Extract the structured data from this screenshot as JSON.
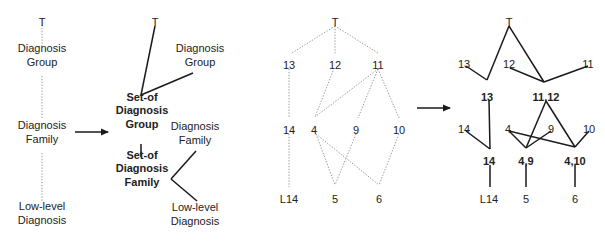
{
  "colors": {
    "text": "#222222",
    "solid_edge": "#1a1a1a",
    "dotted_edge": "#888888",
    "background": "#ffffff"
  },
  "panels": [
    {
      "id": "schema-hierarchy",
      "nodes": [
        {
          "id": "top",
          "lines": [
            "T"
          ],
          "x": 42,
          "y": 22,
          "bold": false
        },
        {
          "id": "diag-group",
          "lines": [
            "Diagnosis",
            "Group"
          ],
          "x": 42,
          "y": 55,
          "bold": false
        },
        {
          "id": "diag-family",
          "lines": [
            "Diagnosis",
            "Family"
          ],
          "x": 42,
          "y": 132,
          "bold": false
        },
        {
          "id": "low-level",
          "lines": [
            "Low-level",
            "Diagnosis"
          ],
          "x": 42,
          "y": 213,
          "bold": false
        }
      ],
      "edges": [
        {
          "from": [
            42,
            25
          ],
          "to": [
            42,
            46
          ],
          "style": "dotted"
        },
        {
          "from": [
            42,
            76
          ],
          "to": [
            42,
            119
          ],
          "style": "dotted"
        },
        {
          "from": [
            42,
            153
          ],
          "to": [
            42,
            202
          ],
          "style": "dotted"
        }
      ]
    },
    {
      "id": "set-of-hierarchy",
      "nodes": [
        {
          "id": "top",
          "lines": [
            "T"
          ],
          "x": 155,
          "y": 22,
          "bold": false
        },
        {
          "id": "diag-group",
          "lines": [
            "Diagnosis",
            "Group"
          ],
          "x": 200,
          "y": 55,
          "bold": false
        },
        {
          "id": "set-of-group",
          "lines": [
            "Set-of",
            "Diagnosis",
            "Group"
          ],
          "x": 142,
          "y": 110,
          "bold": true
        },
        {
          "id": "diag-family",
          "lines": [
            "Diagnosis",
            "Family"
          ],
          "x": 195,
          "y": 133,
          "bold": false
        },
        {
          "id": "set-of-family",
          "lines": [
            "Set-of",
            "Diagnosis",
            "Family"
          ],
          "x": 142,
          "y": 168,
          "bold": true
        },
        {
          "id": "low-level",
          "lines": [
            "Low-level",
            "Diagnosis"
          ],
          "x": 195,
          "y": 214,
          "bold": false
        }
      ],
      "edges": [
        {
          "from": [
            155,
            26
          ],
          "to": [
            141,
            95
          ],
          "style": "solid"
        },
        {
          "from": [
            193,
            73
          ],
          "to": [
            141,
            95
          ],
          "style": "solid"
        },
        {
          "from": [
            141,
            144
          ],
          "to": [
            141,
            157
          ],
          "style": "solid"
        },
        {
          "from": [
            196,
            151
          ],
          "to": [
            171,
            179
          ],
          "style": "solid"
        },
        {
          "from": [
            171,
            179
          ],
          "to": [
            197,
            201
          ],
          "style": "solid"
        }
      ]
    },
    {
      "id": "instance-lattice",
      "nodes": [
        {
          "id": "top",
          "lines": [
            "T"
          ],
          "x": 335,
          "y": 22,
          "bold": false
        },
        {
          "id": "n13",
          "lines": [
            "13"
          ],
          "x": 289,
          "y": 65,
          "bold": false
        },
        {
          "id": "n12",
          "lines": [
            "12"
          ],
          "x": 335,
          "y": 65,
          "bold": false
        },
        {
          "id": "n11",
          "lines": [
            "11"
          ],
          "x": 378,
          "y": 65,
          "bold": false
        },
        {
          "id": "n14",
          "lines": [
            "14"
          ],
          "x": 289,
          "y": 130,
          "bold": false
        },
        {
          "id": "n4",
          "lines": [
            "4"
          ],
          "x": 314,
          "y": 130,
          "bold": false
        },
        {
          "id": "n9",
          "lines": [
            "9"
          ],
          "x": 356,
          "y": 130,
          "bold": false
        },
        {
          "id": "n10",
          "lines": [
            "10"
          ],
          "x": 399,
          "y": 130,
          "bold": false
        },
        {
          "id": "l14",
          "lines": [
            "L14"
          ],
          "x": 289,
          "y": 199,
          "bold": false
        },
        {
          "id": "n5",
          "lines": [
            "5"
          ],
          "x": 335,
          "y": 199,
          "bold": false
        },
        {
          "id": "n6",
          "lines": [
            "6"
          ],
          "x": 379,
          "y": 199,
          "bold": false
        }
      ],
      "edges": [
        {
          "from": [
            335,
            26
          ],
          "to": [
            292,
            53
          ],
          "style": "dotted"
        },
        {
          "from": [
            335,
            26
          ],
          "to": [
            335,
            53
          ],
          "style": "dotted"
        },
        {
          "from": [
            335,
            26
          ],
          "to": [
            378,
            53
          ],
          "style": "dotted"
        },
        {
          "from": [
            289,
            69
          ],
          "to": [
            289,
            118
          ],
          "style": "dotted"
        },
        {
          "from": [
            289,
            134
          ],
          "to": [
            289,
            187
          ],
          "style": "dotted"
        },
        {
          "from": [
            333,
            71
          ],
          "to": [
            315,
            117
          ],
          "style": "dotted"
        },
        {
          "from": [
            378,
            69
          ],
          "to": [
            315,
            117
          ],
          "style": "dotted"
        },
        {
          "from": [
            378,
            69
          ],
          "to": [
            358,
            118
          ],
          "style": "dotted"
        },
        {
          "from": [
            378,
            69
          ],
          "to": [
            399,
            118
          ],
          "style": "dotted"
        },
        {
          "from": [
            316,
            134
          ],
          "to": [
            335,
            185
          ],
          "style": "dotted"
        },
        {
          "from": [
            316,
            134
          ],
          "to": [
            379,
            185
          ],
          "style": "dotted"
        },
        {
          "from": [
            356,
            134
          ],
          "to": [
            335,
            185
          ],
          "style": "dotted"
        },
        {
          "from": [
            399,
            134
          ],
          "to": [
            379,
            185
          ],
          "style": "dotted"
        }
      ]
    },
    {
      "id": "set-of-lattice",
      "nodes": [
        {
          "id": "top",
          "lines": [
            "T"
          ],
          "x": 509,
          "y": 22,
          "bold": false
        },
        {
          "id": "n13",
          "lines": [
            "13"
          ],
          "x": 464,
          "y": 64,
          "bold": false
        },
        {
          "id": "n12",
          "lines": [
            "12"
          ],
          "x": 509,
          "y": 64,
          "bold": false
        },
        {
          "id": "n11",
          "lines": [
            "11"
          ],
          "x": 588,
          "y": 64,
          "bold": false
        },
        {
          "id": "s13",
          "lines": [
            "13"
          ],
          "x": 487,
          "y": 97,
          "bold": true
        },
        {
          "id": "s11-12",
          "lines": [
            "11,12"
          ],
          "x": 546,
          "y": 97,
          "bold": true
        },
        {
          "id": "n14",
          "lines": [
            "14"
          ],
          "x": 464,
          "y": 129,
          "bold": false
        },
        {
          "id": "n4",
          "lines": [
            "4"
          ],
          "x": 508,
          "y": 129,
          "bold": false
        },
        {
          "id": "n9",
          "lines": [
            "9"
          ],
          "x": 551,
          "y": 129,
          "bold": false
        },
        {
          "id": "n10",
          "lines": [
            "10"
          ],
          "x": 589,
          "y": 129,
          "bold": false
        },
        {
          "id": "s14",
          "lines": [
            "14"
          ],
          "x": 489,
          "y": 161,
          "bold": true
        },
        {
          "id": "s4-9",
          "lines": [
            "4,9"
          ],
          "x": 526,
          "y": 161,
          "bold": true
        },
        {
          "id": "s4-10",
          "lines": [
            "4,10"
          ],
          "x": 575,
          "y": 161,
          "bold": true
        },
        {
          "id": "l14",
          "lines": [
            "L14"
          ],
          "x": 489,
          "y": 199,
          "bold": false
        },
        {
          "id": "n5",
          "lines": [
            "5"
          ],
          "x": 526,
          "y": 199,
          "bold": false
        },
        {
          "id": "n6",
          "lines": [
            "6"
          ],
          "x": 575,
          "y": 199,
          "bold": false
        }
      ],
      "edges": [
        {
          "from": [
            509,
            26
          ],
          "to": [
            487,
            80
          ],
          "style": "solid"
        },
        {
          "from": [
            466,
            66
          ],
          "to": [
            487,
            80
          ],
          "style": "solid"
        },
        {
          "from": [
            509,
            26
          ],
          "to": [
            544,
            82
          ],
          "style": "solid"
        },
        {
          "from": [
            510,
            68
          ],
          "to": [
            544,
            82
          ],
          "style": "solid"
        },
        {
          "from": [
            588,
            66
          ],
          "to": [
            544,
            82
          ],
          "style": "solid"
        },
        {
          "from": [
            489,
            100
          ],
          "to": [
            490,
            149
          ],
          "style": "solid"
        },
        {
          "from": [
            466,
            131
          ],
          "to": [
            490,
            149
          ],
          "style": "solid"
        },
        {
          "from": [
            546,
            101
          ],
          "to": [
            526,
            148
          ],
          "style": "solid"
        },
        {
          "from": [
            546,
            101
          ],
          "to": [
            575,
            147
          ],
          "style": "solid"
        },
        {
          "from": [
            509,
            131
          ],
          "to": [
            526,
            148
          ],
          "style": "solid"
        },
        {
          "from": [
            551,
            131
          ],
          "to": [
            526,
            148
          ],
          "style": "solid"
        },
        {
          "from": [
            509,
            131
          ],
          "to": [
            575,
            147
          ],
          "style": "solid"
        },
        {
          "from": [
            589,
            131
          ],
          "to": [
            575,
            147
          ],
          "style": "solid"
        },
        {
          "from": [
            490,
            165
          ],
          "to": [
            490,
            187
          ],
          "style": "solid"
        },
        {
          "from": [
            526,
            165
          ],
          "to": [
            526,
            187
          ],
          "style": "solid"
        },
        {
          "from": [
            575,
            165
          ],
          "to": [
            575,
            187
          ],
          "style": "solid"
        }
      ]
    }
  ],
  "arrows": [
    {
      "id": "arrow-schema-to-setof",
      "from": [
        75,
        132
      ],
      "to": [
        108,
        132
      ]
    },
    {
      "id": "arrow-instance-to-setof",
      "from": [
        417,
        108
      ],
      "to": [
        450,
        108
      ]
    }
  ]
}
